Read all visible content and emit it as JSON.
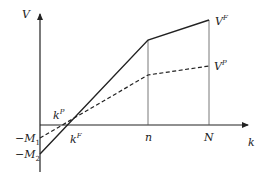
{
  "diagram": {
    "axes": {
      "y_label": "V",
      "x_label": "k",
      "origin": [
        40,
        125
      ]
    },
    "x_ticks": [
      {
        "id": "kF",
        "label": "k",
        "sup": "F"
      },
      {
        "id": "n",
        "label": "n"
      },
      {
        "id": "N",
        "label": "N"
      }
    ],
    "y_ticks": [
      {
        "id": "M1",
        "label": "−M",
        "sub": "1"
      },
      {
        "id": "M2",
        "label": "−M",
        "sub": "2"
      }
    ],
    "intersection_label": {
      "label": "k",
      "sup": "P"
    },
    "series": [
      {
        "name": "V^F",
        "label": "V",
        "sup": "F",
        "style": "solid",
        "points": [
          [
            40,
            154
          ],
          [
            148,
            40
          ],
          [
            209,
            20
          ]
        ]
      },
      {
        "name": "V^P",
        "label": "V",
        "sup": "P",
        "style": "dashed",
        "points": [
          [
            40,
            138
          ],
          [
            148,
            75
          ],
          [
            209,
            66
          ]
        ]
      }
    ],
    "colors": {
      "line": "#222222",
      "guide": "#555555"
    }
  }
}
